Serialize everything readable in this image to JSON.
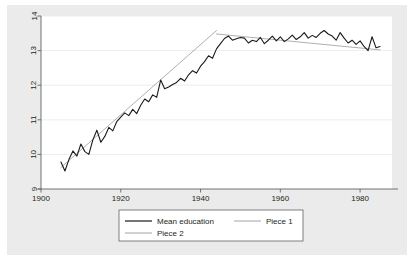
{
  "chart_data": {
    "type": "line",
    "title": "",
    "subtitle": "",
    "xlabel": "",
    "ylabel": "",
    "xlim": [
      1900,
      1988
    ],
    "ylim": [
      9,
      14
    ],
    "xticks": [
      1900,
      1920,
      1940,
      1960,
      1980
    ],
    "xticklabels": [
      "1900",
      "1920",
      "1940",
      "1960",
      "1980"
    ],
    "yticks": [
      9,
      10,
      11,
      12,
      13,
      14
    ],
    "yticklabels": [
      "9",
      "10",
      "11",
      "12",
      "13",
      "14"
    ],
    "grid": "horizontal",
    "legend_position": "bottom-center",
    "legend_entries": [
      "Mean education",
      "Piece 1",
      "Piece 2"
    ],
    "x": [
      1905,
      1906,
      1907,
      1908,
      1909,
      1910,
      1911,
      1912,
      1913,
      1914,
      1915,
      1916,
      1917,
      1918,
      1919,
      1920,
      1921,
      1922,
      1923,
      1924,
      1925,
      1926,
      1927,
      1928,
      1929,
      1930,
      1931,
      1932,
      1933,
      1934,
      1935,
      1936,
      1937,
      1938,
      1939,
      1940,
      1941,
      1942,
      1943,
      1944,
      1945,
      1946,
      1947,
      1948,
      1949,
      1950,
      1951,
      1952,
      1953,
      1954,
      1955,
      1956,
      1957,
      1958,
      1959,
      1960,
      1961,
      1962,
      1963,
      1964,
      1965,
      1966,
      1967,
      1968,
      1969,
      1970,
      1971,
      1972,
      1973,
      1974,
      1975,
      1976,
      1977,
      1978,
      1979,
      1980,
      1981,
      1982,
      1983,
      1984,
      1985
    ],
    "series": [
      {
        "name": "Mean education",
        "color": "#1a1a1a",
        "width": 1.1,
        "values": [
          9.78,
          9.52,
          9.85,
          10.1,
          9.95,
          10.3,
          10.08,
          10.0,
          10.42,
          10.7,
          10.35,
          10.52,
          10.78,
          10.68,
          10.95,
          11.08,
          11.2,
          11.12,
          11.3,
          11.18,
          11.42,
          11.6,
          11.52,
          11.72,
          11.65,
          12.15,
          11.9,
          11.95,
          12.02,
          12.08,
          12.2,
          12.12,
          12.3,
          12.42,
          12.35,
          12.55,
          12.68,
          12.85,
          12.78,
          13.05,
          13.2,
          13.35,
          13.42,
          13.3,
          13.34,
          13.38,
          13.36,
          13.22,
          13.3,
          13.26,
          13.38,
          13.2,
          13.3,
          13.42,
          13.28,
          13.4,
          13.26,
          13.34,
          13.45,
          13.32,
          13.4,
          13.52,
          13.36,
          13.44,
          13.38,
          13.5,
          13.58,
          13.48,
          13.42,
          13.3,
          13.52,
          13.36,
          13.22,
          13.3,
          13.18,
          13.28,
          13.12,
          13.0,
          13.4,
          13.08,
          13.12
        ]
      },
      {
        "name": "Piece 1",
        "color": "#9a9a9a",
        "width": 0.8,
        "fit": "linear",
        "x_range": [
          1905,
          1944
        ],
        "y_range": [
          9.62,
          13.58
        ]
      },
      {
        "name": "Piece 2",
        "color": "#9a9a9a",
        "width": 0.8,
        "fit": "linear",
        "x_range": [
          1944,
          1985
        ],
        "y_range": [
          13.48,
          13.02
        ]
      }
    ]
  },
  "axes": {
    "x_axis_name": "birth-year-axis",
    "y_axis_name": "mean-education-axis"
  },
  "legend": {
    "items": [
      {
        "label": "Mean education",
        "swatch": "line-swatch-mean-education"
      },
      {
        "label": "Piece 1",
        "swatch": "line-swatch-piece-1"
      },
      {
        "label": "Piece 2",
        "swatch": "line-swatch-piece-2"
      }
    ]
  },
  "colors": {
    "figure_background": "#ebebeb",
    "plot_background": "#ffffff",
    "gridline": "#e8e8e8",
    "axis": "#636363",
    "data_line": "#1a1a1a",
    "fit_line": "#9a9a9a",
    "text": "#231f20",
    "legend_border": "#636363"
  }
}
